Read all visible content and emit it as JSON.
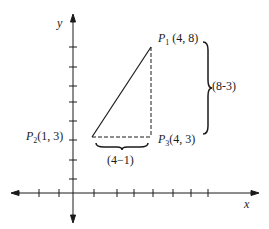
{
  "diagram": {
    "axes": {
      "x_label": "x",
      "y_label": "y"
    },
    "points": {
      "p1": {
        "name": "P",
        "sub": "1",
        "coords": "(4, 8)"
      },
      "p2": {
        "name": "P",
        "sub": "2",
        "coords": "(1, 3)"
      },
      "p3": {
        "name": "P",
        "sub": "3",
        "coords": "(4, 3)"
      }
    },
    "braces": {
      "vertical_label": "(8-3)",
      "horizontal_label": "(4−1)"
    },
    "colors": {
      "ink": "#1a1a1a",
      "background": "#ffffff"
    }
  }
}
